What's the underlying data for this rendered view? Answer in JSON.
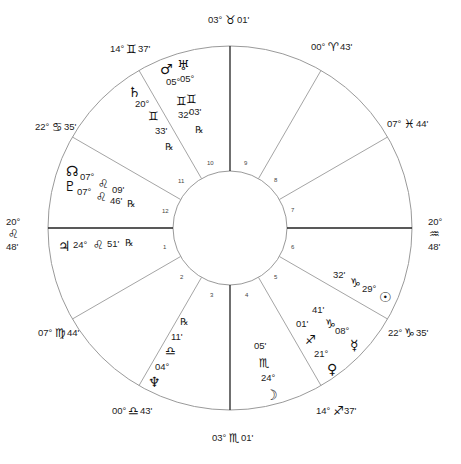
{
  "chart": {
    "type": "natal-wheel",
    "colors": {
      "line": "#9a9a9a",
      "axis": "#222222",
      "text": "#222222",
      "background": "#ffffff"
    }
  },
  "cusps": {
    "mc": {
      "deg": "03°",
      "sign": "♉",
      "min": "01'"
    },
    "c9": {
      "deg": "00°",
      "sign": "♈",
      "min": "43'"
    },
    "c8": {
      "deg": "07°",
      "sign": "♓",
      "min": "44'"
    },
    "dsc": {
      "deg": "20°",
      "sign": "♒",
      "min": "48'"
    },
    "c6": {
      "deg": "22°",
      "sign": "♑",
      "min": "35'"
    },
    "c5": {
      "deg": "14°",
      "sign": "♐",
      "min": "37'"
    },
    "ic": {
      "deg": "03°",
      "sign": "♏",
      "min": "01'"
    },
    "c3": {
      "deg": "00°",
      "sign": "♎",
      "min": "43'"
    },
    "c2": {
      "deg": "07°",
      "sign": "♍",
      "min": "44'"
    },
    "asc": {
      "deg": "20°",
      "sign": "♌",
      "min": "48'"
    },
    "c12": {
      "deg": "22°",
      "sign": "♋",
      "min": "35'"
    },
    "c11": {
      "deg": "14°",
      "sign": "♊",
      "min": "37'"
    }
  },
  "houses": [
    "1",
    "2",
    "3",
    "4",
    "5",
    "6",
    "7",
    "8",
    "9",
    "10",
    "11",
    "12"
  ],
  "planets": {
    "mars": {
      "glyph": "♂",
      "deg": "05°",
      "sign": "♊",
      "min": "32'"
    },
    "uranus": {
      "glyph": "♅",
      "deg": "05°",
      "sign": "♊",
      "min": "03'",
      "retro": "℞"
    },
    "saturn": {
      "glyph": "♄",
      "deg": "20°",
      "sign": "♊",
      "min": "33'",
      "retro": "℞"
    },
    "node": {
      "glyph": "☊",
      "deg": "07°",
      "sign": "♌",
      "min": "09'"
    },
    "pluto": {
      "glyph": "♇",
      "deg": "07°",
      "sign": "♌",
      "min": "46'",
      "retro": "℞"
    },
    "jupiter": {
      "glyph": "♃",
      "deg": "24°",
      "sign": "♌",
      "min": "51'",
      "retro": "℞"
    },
    "neptune": {
      "glyph": "♆",
      "deg": "04°",
      "sign": "♎",
      "min": "11'",
      "retro": "℞"
    },
    "moon": {
      "glyph": "☽",
      "deg": "24°",
      "sign": "♏",
      "min": "05'"
    },
    "venus": {
      "glyph": "♀",
      "deg": "21°",
      "sign": "♐",
      "min": "01'"
    },
    "mercury": {
      "glyph": "☿",
      "deg": "08°",
      "sign": "♑",
      "min": "41'"
    },
    "sun": {
      "glyph": "☉",
      "deg": "29°",
      "sign": "♑",
      "min": "32'"
    }
  }
}
